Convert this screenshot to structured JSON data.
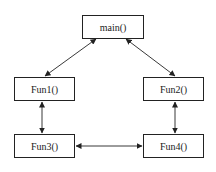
{
  "nodes": [
    {
      "id": "main",
      "label": "main()"
    },
    {
      "id": "fun1",
      "label": "Fun1()"
    },
    {
      "id": "fun2",
      "label": "Fun2()"
    },
    {
      "id": "fun3",
      "label": "Fun3()"
    },
    {
      "id": "fun4",
      "label": "Fun4()"
    }
  ],
  "edges": [
    {
      "from": "main",
      "to": "fun1",
      "bidirectional": true
    },
    {
      "from": "main",
      "to": "fun2",
      "bidirectional": true
    },
    {
      "from": "fun1",
      "to": "fun3",
      "bidirectional": true
    },
    {
      "from": "fun2",
      "to": "fun4",
      "bidirectional": true
    },
    {
      "from": "fun3",
      "to": "fun4",
      "bidirectional": true
    }
  ]
}
